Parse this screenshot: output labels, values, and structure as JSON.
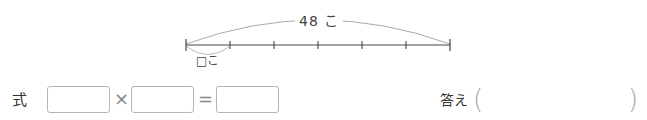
{
  "diagram": {
    "total_label": "48 こ",
    "unit_label": "□こ",
    "segments": 6,
    "line_color": "#444444",
    "arc_color": "#aaaaaa"
  },
  "equation": {
    "label": "式",
    "operator_multiply": "×",
    "operator_equals": "=",
    "boxes": [
      "",
      "",
      ""
    ]
  },
  "answer": {
    "label": "答え",
    "open_paren": "(",
    "close_paren": ")",
    "value": ""
  }
}
